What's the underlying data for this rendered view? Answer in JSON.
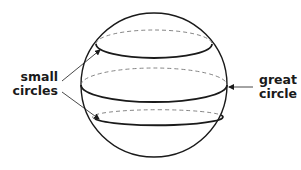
{
  "labels": {
    "small_circles": [
      "small",
      "circles"
    ],
    "great_circle": [
      "great",
      "circle"
    ]
  },
  "colors": {
    "stroke": "#1a1a1a",
    "dashed": "#777777",
    "background": "#ffffff"
  }
}
